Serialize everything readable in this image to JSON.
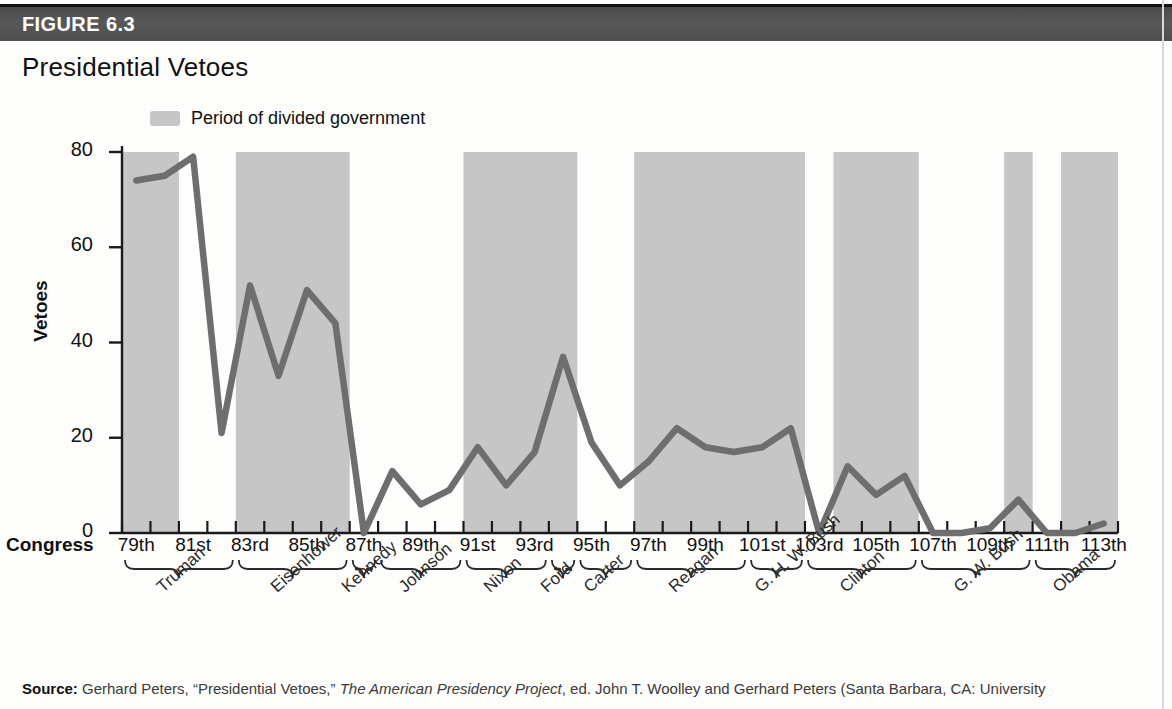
{
  "figure": {
    "number_label": "FIGURE 6.3",
    "title": "Presidential Vetoes"
  },
  "legend": {
    "swatch_name": "divided-government-swatch",
    "label": "Period of divided government",
    "swatch_color": "#c6c6c6"
  },
  "axis": {
    "y_title": "Vetoes",
    "x_title": "Congress",
    "y_ticks": [
      "0",
      "20",
      "40",
      "60",
      "80"
    ],
    "y_min": 0,
    "y_max": 80
  },
  "source": {
    "bold_prefix": "Source:",
    "text_1": " Gerhard Peters, “Presidential Vetoes,” ",
    "italic": "The American Presidency Project",
    "text_2": ", ed. John T. Woolley and Gerhard Peters (Santa Barbara, CA: University"
  },
  "colors": {
    "line": "#6e6e6e",
    "shade": "#c6c6c6",
    "axis": "#1a1a1a",
    "header_bar": "#505050"
  },
  "chart_data": {
    "type": "line",
    "title": "Presidential Vetoes",
    "xlabel": "Congress",
    "ylabel": "Vetoes",
    "ylim": [
      0,
      80
    ],
    "grid": false,
    "legend_position": "top-left",
    "categories": [
      "79th",
      "80th",
      "81st",
      "82nd",
      "83rd",
      "84th",
      "85th",
      "86th",
      "87th",
      "88th",
      "89th",
      "90th",
      "91st",
      "92nd",
      "93rd",
      "94th",
      "95th",
      "96th",
      "97th",
      "98th",
      "99th",
      "100th",
      "101st",
      "102nd",
      "103rd",
      "104th",
      "105th",
      "106th",
      "107th",
      "108th",
      "109th",
      "110th",
      "111th",
      "112th",
      "113th"
    ],
    "x_tick_labels": [
      "79th",
      "",
      "81st",
      "",
      "83rd",
      "",
      "85th",
      "",
      "87th",
      "",
      "89th",
      "",
      "91st",
      "",
      "93rd",
      "",
      "95th",
      "",
      "97th",
      "",
      "99th",
      "",
      "101st",
      "",
      "103rd",
      "",
      "105th",
      "",
      "107th",
      "",
      "109th",
      "",
      "111th",
      "",
      "113th"
    ],
    "series": [
      {
        "name": "Vetoes",
        "values": [
          74,
          75,
          79,
          21,
          52,
          33,
          51,
          44,
          0,
          13,
          6,
          9,
          18,
          10,
          17,
          37,
          19,
          10,
          15,
          22,
          18,
          17,
          18,
          22,
          0,
          14,
          8,
          12,
          0,
          0,
          1,
          7,
          0,
          0,
          2
        ]
      }
    ],
    "shaded_regions": [
      {
        "label": "divided government",
        "start": "79th",
        "end": "80th"
      },
      {
        "label": "divided government",
        "start": "83rd",
        "end": "86th"
      },
      {
        "label": "divided government",
        "start": "91st",
        "end": "94th"
      },
      {
        "label": "divided government",
        "start": "97th",
        "end": "102nd"
      },
      {
        "label": "divided government",
        "start": "104th",
        "end": "106th"
      },
      {
        "label": "divided government",
        "start": "110th",
        "end": "110th"
      },
      {
        "label": "divided government",
        "start": "112th",
        "end": "113th"
      }
    ],
    "president_brackets": [
      {
        "name": "Truman",
        "start": "79th",
        "end": "82nd"
      },
      {
        "name": "Eisenhower",
        "start": "83rd",
        "end": "86th"
      },
      {
        "name": "Kennedy",
        "start": "87th",
        "end": "87th"
      },
      {
        "name": "Johnson",
        "start": "88th",
        "end": "90th"
      },
      {
        "name": "Nixon",
        "start": "91st",
        "end": "93rd"
      },
      {
        "name": "Ford",
        "start": "94th",
        "end": "94th"
      },
      {
        "name": "Carter",
        "start": "95th",
        "end": "96th"
      },
      {
        "name": "Reagan",
        "start": "97th",
        "end": "100th"
      },
      {
        "name": "G. H. W. Bush",
        "start": "101st",
        "end": "102nd"
      },
      {
        "name": "Clinton",
        "start": "103rd",
        "end": "106th"
      },
      {
        "name": "G. W. Bush",
        "start": "107th",
        "end": "110th"
      },
      {
        "name": "Obama",
        "start": "111th",
        "end": "113th"
      }
    ]
  }
}
